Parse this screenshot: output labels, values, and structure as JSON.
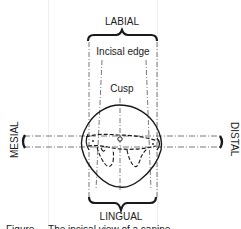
{
  "diagram": {
    "type": "dental-orientation-diagram",
    "labels": {
      "top": "LABIAL",
      "bottom": "LINGUAL",
      "left": "MESIAL",
      "right": "DISTAL",
      "incisal_edge": "Incisal edge",
      "cusp": "Cusp"
    },
    "caption_partial": "Figure ... The incisal view of a canine...",
    "colors": {
      "line": "#1a1a1a",
      "dashed": "#555555",
      "background": "#ffffff"
    }
  }
}
